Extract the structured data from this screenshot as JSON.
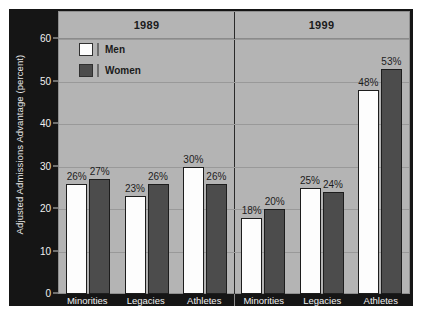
{
  "chart_data": {
    "type": "bar",
    "title": "",
    "xlabel": "",
    "ylabel": "Adjusted Admissions Advantage (percent)",
    "ylim": [
      0,
      60
    ],
    "yticks": [
      0,
      10,
      20,
      30,
      40,
      50,
      60
    ],
    "grid": true,
    "legend_position": "inside-top-left",
    "panels": [
      {
        "label": "1989",
        "categories": [
          "Minorities",
          "Legacies",
          "Athletes"
        ],
        "series": [
          {
            "name": "Men",
            "values": [
              26,
              23,
              30
            ],
            "labels": [
              "26%",
              "23%",
              "30%"
            ],
            "color": "#fdfdfd"
          },
          {
            "name": "Women",
            "values": [
              27,
              26,
              26
            ],
            "labels": [
              "27%",
              "26%",
              "26%"
            ],
            "color": "#4c4c4c"
          }
        ]
      },
      {
        "label": "1999",
        "categories": [
          "Minorities",
          "Legacies",
          "Athletes"
        ],
        "series": [
          {
            "name": "Men",
            "values": [
              18,
              25,
              48
            ],
            "labels": [
              "18%",
              "25%",
              "48%"
            ],
            "color": "#fdfdfd"
          },
          {
            "name": "Women",
            "values": [
              20,
              24,
              53
            ],
            "labels": [
              "20%",
              "24%",
              "53%"
            ],
            "color": "#4c4c4c"
          }
        ]
      }
    ],
    "legend": [
      {
        "name": "Men",
        "color": "#fdfdfd"
      },
      {
        "name": "Women",
        "color": "#4c4c4c"
      }
    ]
  },
  "colors": {
    "frame": "#151515",
    "plot_background": "#b4b4b4",
    "gridline": "#999999",
    "men_bar": "#fdfdfd",
    "women_bar": "#4c4c4c",
    "bar_outline": "#1d1d1d",
    "axis_text_light": "#f0f0f0",
    "label_text_dark": "#1d1d1d"
  }
}
